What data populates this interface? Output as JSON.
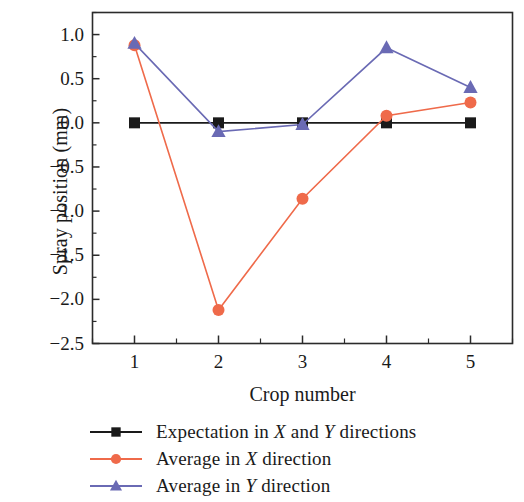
{
  "chart_data": {
    "type": "line",
    "title": "",
    "xlabel": "Crop number",
    "ylabel": "Spray position (mm)",
    "x": [
      1,
      2,
      3,
      4,
      5
    ],
    "categories": [
      "1",
      "2",
      "3",
      "4",
      "5"
    ],
    "xlim": [
      0.5,
      5.5
    ],
    "ylim": [
      -2.5,
      1.25
    ],
    "yticks": [
      1.0,
      0.5,
      0.0,
      -0.5,
      -1.0,
      -1.5,
      -2.0,
      -2.5
    ],
    "ytick_labels": [
      "1.0",
      "0.5",
      "0.0",
      "−0.5",
      "−1.0",
      "−1.5",
      "−2.0",
      "−2.5"
    ],
    "xticks": [
      1,
      2,
      3,
      4,
      5
    ],
    "xtick_labels": [
      "1",
      "2",
      "3",
      "4",
      "5"
    ],
    "minor_ticks": true,
    "grid": false,
    "legend_position": "below",
    "series": [
      {
        "name": "Expectation in X and Y directions",
        "label_plain": "Expectation in X and Y directions",
        "label_parts": [
          "Expectation in ",
          "X",
          " and ",
          "Y",
          " directions"
        ],
        "color": "#1a1a1a",
        "marker": "square",
        "values": [
          0.0,
          0.0,
          0.0,
          0.0,
          0.0
        ]
      },
      {
        "name": "Average in X direction",
        "label_plain": "Average in X direction",
        "label_parts": [
          "Average in ",
          "X",
          " direction"
        ],
        "color": "#ef6a4a",
        "marker": "circle",
        "values": [
          0.88,
          -2.12,
          -0.86,
          0.08,
          0.23
        ]
      },
      {
        "name": "Average in Y direction",
        "label_plain": "Average in Y direction",
        "label_parts": [
          "Average in ",
          "Y",
          " direction"
        ],
        "color": "#6a6ab4",
        "marker": "triangle",
        "values": [
          0.9,
          -0.1,
          -0.02,
          0.85,
          0.4
        ]
      }
    ]
  },
  "axes": {
    "ylabel": "Spray position (mm)",
    "xlabel": "Crop number"
  },
  "legend": {
    "items": [
      {
        "text": "Expectation in X and Y directions"
      },
      {
        "text": "Average in X direction"
      },
      {
        "text": "Average in Y direction"
      }
    ]
  },
  "colors": {
    "expectation": "#1a1a1a",
    "average_x": "#ef6a4a",
    "average_y": "#6a6ab4",
    "axis": "#2b2b2b",
    "background": "#ffffff"
  }
}
